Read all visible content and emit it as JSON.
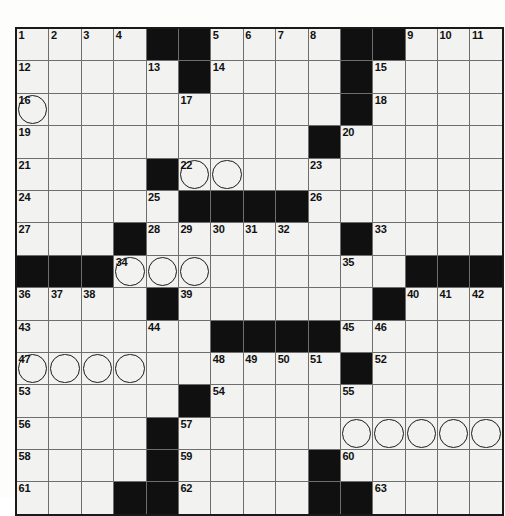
{
  "puzzle": {
    "type": "crossword-grid",
    "columns": 15,
    "rows": 15,
    "cell_size_px": 31.4,
    "colors": {
      "block": "#101010",
      "cell": "#f2f2f0",
      "gridline": "#6e6e6e",
      "border": "#1a1a1a",
      "number": "#111111"
    },
    "rows_data": [
      [
        {
          "n": "1"
        },
        {
          "n": "2"
        },
        {
          "n": "3"
        },
        {
          "n": "4"
        },
        {
          "b": true
        },
        {
          "b": true
        },
        {
          "n": "5"
        },
        {
          "n": "6"
        },
        {
          "n": "7"
        },
        {
          "n": "8"
        },
        {
          "b": true
        },
        {
          "b": true
        },
        {
          "n": "9"
        },
        {
          "n": "10"
        },
        {
          "n": "11"
        }
      ],
      [
        {
          "n": "12"
        },
        {},
        {},
        {},
        {
          "n": "13"
        },
        {
          "b": true
        },
        {
          "n": "14"
        },
        {},
        {},
        {},
        {
          "b": true
        },
        {
          "n": "15"
        },
        {},
        {},
        {}
      ],
      [
        {
          "n": "16",
          "c": true
        },
        {},
        {},
        {},
        {},
        {
          "n": "17"
        },
        {},
        {},
        {},
        {},
        {
          "b": true
        },
        {
          "n": "18"
        },
        {},
        {},
        {}
      ],
      [
        {
          "n": "19"
        },
        {},
        {},
        {},
        {},
        {},
        {},
        {},
        {},
        {
          "b": true
        },
        {
          "n": "20"
        },
        {},
        {},
        {},
        {}
      ],
      [
        {
          "n": "21"
        },
        {},
        {},
        {},
        {
          "b": true
        },
        {
          "n": "22",
          "c": true
        },
        {
          "c": true
        },
        {},
        {},
        {
          "n": "23"
        },
        {},
        {},
        {},
        {},
        {}
      ],
      [
        {
          "n": "24"
        },
        {},
        {},
        {},
        {
          "n": "25"
        },
        {
          "b": true
        },
        {
          "b": true
        },
        {
          "b": true
        },
        {
          "b": true
        },
        {
          "n": "26"
        },
        {},
        {},
        {},
        {},
        {}
      ],
      [
        {
          "n": "27"
        },
        {},
        {},
        {
          "b": true
        },
        {
          "n": "28"
        },
        {
          "n": "29"
        },
        {
          "n": "30"
        },
        {
          "n": "31"
        },
        {
          "n": "32"
        },
        {},
        {
          "b": true
        },
        {
          "n": "33"
        },
        {},
        {},
        {}
      ],
      [
        {
          "b": true
        },
        {
          "b": true
        },
        {
          "b": true
        },
        {
          "n": "34",
          "c": true
        },
        {
          "c": true
        },
        {
          "c": true
        },
        {},
        {},
        {},
        {},
        {
          "n": "35"
        },
        {},
        {
          "b": true
        },
        {
          "b": true
        },
        {
          "b": true
        }
      ],
      [
        {
          "n": "36"
        },
        {
          "n": "37"
        },
        {
          "n": "38"
        },
        {},
        {
          "b": true
        },
        {
          "n": "39"
        },
        {},
        {},
        {},
        {},
        {},
        {
          "b": true
        },
        {
          "n": "40"
        },
        {
          "n": "41"
        },
        {
          "n": "42"
        }
      ],
      [
        {
          "n": "43"
        },
        {},
        {},
        {},
        {
          "n": "44"
        },
        {},
        {
          "b": true
        },
        {
          "b": true
        },
        {
          "b": true
        },
        {
          "b": true
        },
        {
          "n": "45"
        },
        {
          "n": "46"
        },
        {},
        {},
        {}
      ],
      [
        {
          "n": "47",
          "c": true
        },
        {
          "c": true
        },
        {
          "c": true
        },
        {
          "c": true
        },
        {},
        {},
        {
          "n": "48"
        },
        {
          "n": "49"
        },
        {
          "n": "50"
        },
        {
          "n": "51"
        },
        {
          "b": true
        },
        {
          "n": "52"
        },
        {},
        {},
        {}
      ],
      [
        {
          "n": "53"
        },
        {},
        {},
        {},
        {},
        {
          "b": true
        },
        {
          "n": "54"
        },
        {},
        {},
        {},
        {
          "n": "55"
        },
        {},
        {},
        {},
        {}
      ],
      [
        {
          "n": "56"
        },
        {},
        {},
        {},
        {
          "b": true
        },
        {
          "n": "57"
        },
        {},
        {},
        {},
        {},
        {
          "c": true
        },
        {
          "c": true
        },
        {
          "c": true
        },
        {
          "c": true
        },
        {
          "c": true
        }
      ],
      [
        {
          "n": "58"
        },
        {},
        {},
        {},
        {
          "b": true
        },
        {
          "n": "59"
        },
        {},
        {},
        {},
        {
          "b": true
        },
        {
          "n": "60"
        },
        {},
        {},
        {},
        {}
      ],
      [
        {
          "n": "61"
        },
        {},
        {},
        {
          "b": true
        },
        {
          "b": true
        },
        {
          "n": "62"
        },
        {},
        {},
        {},
        {
          "b": true
        },
        {
          "b": true
        },
        {
          "n": "63"
        },
        {},
        {},
        {}
      ]
    ]
  }
}
